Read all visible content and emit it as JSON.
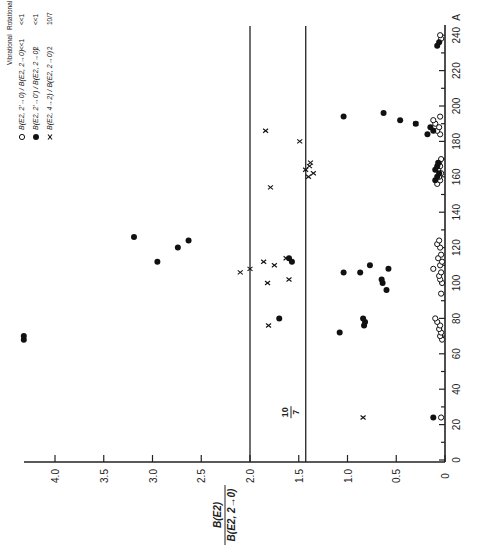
{
  "chart_data": {
    "type": "scatter",
    "orientation_note": "figure printed rotated 90 degrees counter-clockwise",
    "title": "",
    "xlabel": "A",
    "ylabel": "B(E2) / B(E2, 2→0)",
    "xlim": [
      0,
      250
    ],
    "ylim": [
      0,
      4.4
    ],
    "x_ticks": [
      0,
      20,
      40,
      60,
      80,
      100,
      120,
      140,
      160,
      180,
      200,
      220,
      240
    ],
    "y_ticks": [
      0,
      0.5,
      1.0,
      1.5,
      2.0,
      2.5,
      3.0,
      3.5,
      4.0
    ],
    "y_tick_labels": [
      "0",
      "0.5",
      "1.0",
      "1.5",
      "2.0",
      "2.5",
      "3.0",
      "3.5",
      "4.0"
    ],
    "x_unit_label": "A",
    "grid": false,
    "reference_lines": [
      {
        "y": 2.0,
        "label": ""
      },
      {
        "y": 1.4286,
        "label": "10/7"
      }
    ],
    "reference_label": {
      "numerator": "10",
      "denominator": "7"
    },
    "legend": {
      "position": "upper-left (rotated)",
      "header": [
        "Vibrational",
        "Rotational"
      ],
      "entries": [
        {
          "marker": "open-circle",
          "text": "B(E2, 2'→0) / B(E2, 2→0)",
          "vibrational": "<<1",
          "rotational": "<<1"
        },
        {
          "marker": "filled-circle",
          "text": "B(E2, 2'→0') / B(E2, 2→0)",
          "vibrational": "2",
          "rotational": "<<1"
        },
        {
          "marker": "x",
          "text": "B(E2, 4→2) / B(E2, 2→0)",
          "vibrational": "2",
          "rotational": "10/7"
        }
      ]
    },
    "series": [
      {
        "name": "B(E2, 2'→0) / B(E2, 2→0)",
        "marker": "open-circle",
        "points": [
          [
            24,
            0.04
          ],
          [
            68,
            0.03
          ],
          [
            70,
            0.05
          ],
          [
            72,
            0.04
          ],
          [
            74,
            0.06
          ],
          [
            76,
            0.05
          ],
          [
            78,
            0.08
          ],
          [
            80,
            0.1
          ],
          [
            94,
            0.04
          ],
          [
            100,
            0.03
          ],
          [
            102,
            0.05
          ],
          [
            104,
            0.06
          ],
          [
            106,
            0.04
          ],
          [
            108,
            0.12
          ],
          [
            110,
            0.05
          ],
          [
            112,
            0.03
          ],
          [
            114,
            0.07
          ],
          [
            116,
            0.04
          ],
          [
            120,
            0.05
          ],
          [
            122,
            0.08
          ],
          [
            124,
            0.06
          ],
          [
            156,
            0.08
          ],
          [
            158,
            0.05
          ],
          [
            160,
            0.06
          ],
          [
            162,
            0.04
          ],
          [
            164,
            0.07
          ],
          [
            166,
            0.05
          ],
          [
            168,
            0.06
          ],
          [
            170,
            0.04
          ],
          [
            184,
            0.05
          ],
          [
            186,
            0.08
          ],
          [
            188,
            0.06
          ],
          [
            190,
            0.1
          ],
          [
            192,
            0.12
          ],
          [
            194,
            0.05
          ],
          [
            238,
            0.04
          ],
          [
            240,
            0.05
          ]
        ]
      },
      {
        "name": "B(E2, 2'→0') / B(E2, 2→0)",
        "marker": "filled-circle",
        "points": [
          [
            24,
            0.12
          ],
          [
            68,
            4.32
          ],
          [
            70,
            4.32
          ],
          [
            72,
            1.08
          ],
          [
            76,
            0.83
          ],
          [
            78,
            0.82
          ],
          [
            80,
            0.84
          ],
          [
            80,
            1.7
          ],
          [
            96,
            0.6
          ],
          [
            100,
            0.64
          ],
          [
            102,
            0.65
          ],
          [
            106,
            0.87
          ],
          [
            106,
            1.04
          ],
          [
            108,
            0.58
          ],
          [
            110,
            0.77
          ],
          [
            112,
            1.57
          ],
          [
            112,
            2.95
          ],
          [
            114,
            1.6
          ],
          [
            120,
            2.74
          ],
          [
            124,
            2.63
          ],
          [
            126,
            3.19
          ],
          [
            158,
            0.1
          ],
          [
            160,
            0.08
          ],
          [
            162,
            0.06
          ],
          [
            164,
            0.1
          ],
          [
            166,
            0.08
          ],
          [
            168,
            0.07
          ],
          [
            184,
            0.18
          ],
          [
            186,
            0.12
          ],
          [
            188,
            0.15
          ],
          [
            190,
            0.3
          ],
          [
            192,
            0.46
          ],
          [
            194,
            1.04
          ],
          [
            196,
            0.63
          ],
          [
            234,
            0.08
          ],
          [
            236,
            0.06
          ]
        ]
      },
      {
        "name": "B(E2, 4→2) / B(E2, 2→0)",
        "marker": "x",
        "points": [
          [
            24,
            0.84
          ],
          [
            76,
            1.81
          ],
          [
            100,
            1.82
          ],
          [
            102,
            1.6
          ],
          [
            106,
            2.1
          ],
          [
            108,
            2.0
          ],
          [
            110,
            1.75
          ],
          [
            112,
            1.86
          ],
          [
            114,
            1.63
          ],
          [
            154,
            1.79
          ],
          [
            160,
            1.4
          ],
          [
            162,
            1.35
          ],
          [
            164,
            1.43
          ],
          [
            166,
            1.39
          ],
          [
            168,
            1.38
          ],
          [
            180,
            1.49
          ],
          [
            186,
            1.84
          ],
          [
            190,
            0.3
          ]
        ]
      }
    ]
  }
}
